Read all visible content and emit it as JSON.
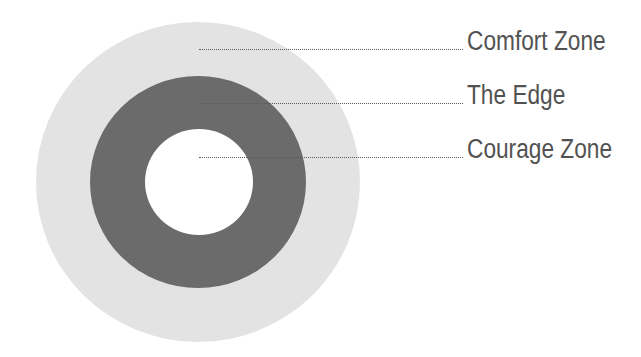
{
  "diagram": {
    "type": "concentric-circles",
    "colors": {
      "comfort_zone": "#e3e3e3",
      "the_edge": "#6b6b6b",
      "courage_zone": "#ffffff",
      "text": "#525252",
      "leader_line": "#5a5a5a"
    },
    "labels": [
      {
        "text": "Comfort Zone"
      },
      {
        "text": "The Edge"
      },
      {
        "text": "Courage Zone"
      }
    ]
  }
}
